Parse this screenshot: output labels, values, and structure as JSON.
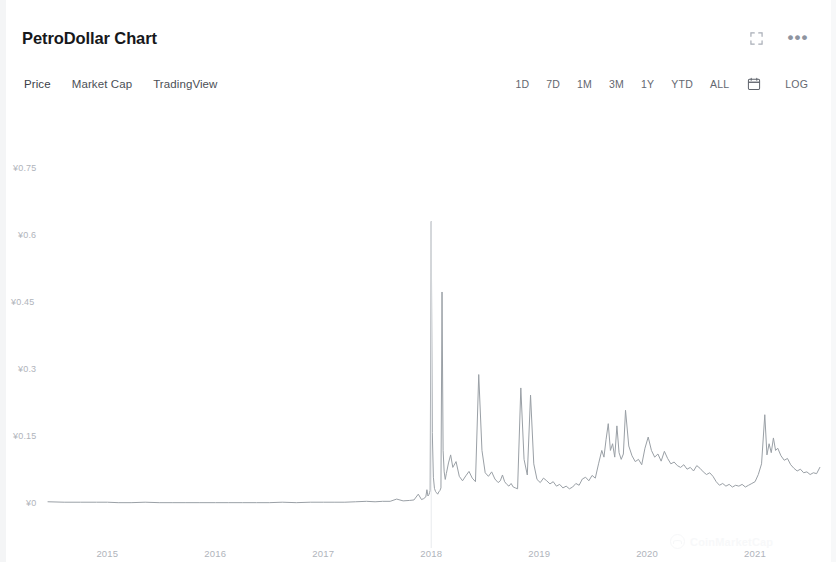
{
  "header": {
    "title": "PetroDollar Chart",
    "expand_icon": "fullscreen-icon",
    "more_icon": "more-options-icon"
  },
  "toolbar": {
    "tabs": [
      {
        "label": "Price",
        "active": true
      },
      {
        "label": "Market Cap",
        "active": false
      },
      {
        "label": "TradingView",
        "active": false
      }
    ],
    "ranges": [
      {
        "label": "1D"
      },
      {
        "label": "7D"
      },
      {
        "label": "1M"
      },
      {
        "label": "3M"
      },
      {
        "label": "1Y"
      },
      {
        "label": "YTD"
      },
      {
        "label": "ALL"
      }
    ],
    "calendar_icon": "calendar-icon",
    "log_label": "LOG"
  },
  "watermark": {
    "text": "CoinMarketCap",
    "logo": "coinmarketcap-logo"
  },
  "colors": {
    "line": "#9aa0a6",
    "title": "#17181b",
    "tick": "#b0b4bb",
    "background": "#ffffff"
  },
  "chart_data": {
    "type": "line",
    "title": "PetroDollar Chart",
    "xlabel": "",
    "ylabel": "",
    "currency_symbol": "¥",
    "grid": false,
    "legend": null,
    "y_ticks": [
      "¥0.75",
      "¥0.6",
      "¥0.45",
      "¥0.3",
      "¥0.15",
      "¥0"
    ],
    "y_tick_values": [
      0.75,
      0.6,
      0.45,
      0.3,
      0.15,
      0
    ],
    "ylim": [
      0,
      0.82
    ],
    "x_ticks": [
      "2015",
      "2016",
      "2017",
      "2018",
      "2019",
      "2020",
      "2021"
    ],
    "x_tick_values": [
      2015,
      2016,
      2017,
      2018,
      2019,
      2020,
      2021
    ],
    "xlim": [
      2014.45,
      2021.62
    ],
    "series": [
      {
        "name": "Price",
        "color": "#9aa0a6",
        "x": [
          2014.45,
          2014.6,
          2014.75,
          2014.9,
          2015.0,
          2015.1,
          2015.22,
          2015.35,
          2015.48,
          2015.6,
          2015.72,
          2015.85,
          2016.0,
          2016.12,
          2016.25,
          2016.38,
          2016.5,
          2016.62,
          2016.75,
          2016.88,
          2017.0,
          2017.1,
          2017.2,
          2017.3,
          2017.4,
          2017.48,
          2017.55,
          2017.62,
          2017.68,
          2017.74,
          2017.8,
          2017.84,
          2017.88,
          2017.91,
          2017.93,
          2017.95,
          2017.96,
          2017.97,
          2017.975,
          2017.98,
          2017.985,
          2017.99,
          2018.0,
          2018.01,
          2018.02,
          2018.03,
          2018.04,
          2018.05,
          2018.06,
          2018.07,
          2018.08,
          2018.09,
          2018.1,
          2018.11,
          2018.12,
          2018.13,
          2018.14,
          2018.16,
          2018.18,
          2018.2,
          2018.23,
          2018.26,
          2018.29,
          2018.32,
          2018.35,
          2018.38,
          2018.41,
          2018.44,
          2018.47,
          2018.5,
          2018.53,
          2018.56,
          2018.59,
          2018.62,
          2018.64,
          2018.66,
          2018.68,
          2018.7,
          2018.72,
          2018.74,
          2018.76,
          2018.78,
          2018.8,
          2018.83,
          2018.86,
          2018.89,
          2018.92,
          2018.95,
          2018.98,
          2019.01,
          2019.04,
          2019.07,
          2019.1,
          2019.13,
          2019.16,
          2019.19,
          2019.22,
          2019.25,
          2019.28,
          2019.31,
          2019.34,
          2019.37,
          2019.4,
          2019.43,
          2019.46,
          2019.49,
          2019.52,
          2019.55,
          2019.58,
          2019.6,
          2019.62,
          2019.64,
          2019.66,
          2019.68,
          2019.7,
          2019.72,
          2019.74,
          2019.76,
          2019.78,
          2019.8,
          2019.83,
          2019.86,
          2019.89,
          2019.92,
          2019.95,
          2019.98,
          2020.01,
          2020.04,
          2020.07,
          2020.1,
          2020.13,
          2020.16,
          2020.19,
          2020.22,
          2020.25,
          2020.28,
          2020.31,
          2020.34,
          2020.37,
          2020.4,
          2020.43,
          2020.46,
          2020.49,
          2020.52,
          2020.55,
          2020.58,
          2020.61,
          2020.64,
          2020.67,
          2020.7,
          2020.73,
          2020.76,
          2020.79,
          2020.82,
          2020.85,
          2020.88,
          2020.91,
          2020.94,
          2020.97,
          2021.0,
          2021.03,
          2021.06,
          2021.09,
          2021.11,
          2021.13,
          2021.15,
          2021.17,
          2021.19,
          2021.21,
          2021.24,
          2021.27,
          2021.3,
          2021.33,
          2021.36,
          2021.39,
          2021.42,
          2021.45,
          2021.48,
          2021.51,
          2021.54,
          2021.57,
          2021.6
        ],
        "y": [
          0.005,
          0.004,
          0.004,
          0.004,
          0.004,
          0.003,
          0.003,
          0.004,
          0.003,
          0.003,
          0.003,
          0.003,
          0.003,
          0.003,
          0.003,
          0.003,
          0.003,
          0.004,
          0.003,
          0.004,
          0.004,
          0.004,
          0.004,
          0.005,
          0.006,
          0.005,
          0.006,
          0.006,
          0.011,
          0.007,
          0.008,
          0.009,
          0.022,
          0.01,
          0.012,
          0.016,
          0.032,
          0.018,
          0.02,
          0.021,
          0.026,
          0.03,
          0.633,
          0.16,
          0.06,
          0.035,
          0.028,
          0.025,
          0.022,
          0.027,
          0.03,
          0.036,
          0.475,
          0.12,
          0.072,
          0.055,
          0.068,
          0.092,
          0.11,
          0.082,
          0.095,
          0.062,
          0.052,
          0.063,
          0.073,
          0.058,
          0.05,
          0.29,
          0.12,
          0.07,
          0.062,
          0.072,
          0.056,
          0.048,
          0.052,
          0.065,
          0.05,
          0.044,
          0.04,
          0.046,
          0.038,
          0.036,
          0.034,
          0.26,
          0.1,
          0.065,
          0.244,
          0.09,
          0.055,
          0.048,
          0.058,
          0.052,
          0.045,
          0.05,
          0.04,
          0.044,
          0.036,
          0.04,
          0.034,
          0.038,
          0.046,
          0.042,
          0.056,
          0.06,
          0.052,
          0.064,
          0.058,
          0.09,
          0.12,
          0.105,
          0.145,
          0.18,
          0.12,
          0.135,
          0.105,
          0.175,
          0.115,
          0.1,
          0.112,
          0.21,
          0.13,
          0.108,
          0.095,
          0.1,
          0.088,
          0.125,
          0.15,
          0.12,
          0.105,
          0.112,
          0.096,
          0.118,
          0.102,
          0.09,
          0.094,
          0.086,
          0.082,
          0.088,
          0.078,
          0.082,
          0.074,
          0.086,
          0.08,
          0.072,
          0.066,
          0.07,
          0.062,
          0.05,
          0.042,
          0.046,
          0.04,
          0.044,
          0.038,
          0.042,
          0.04,
          0.044,
          0.038,
          0.042,
          0.046,
          0.05,
          0.066,
          0.09,
          0.2,
          0.11,
          0.135,
          0.115,
          0.148,
          0.12,
          0.125,
          0.108,
          0.098,
          0.102,
          0.088,
          0.08,
          0.074,
          0.078,
          0.07,
          0.072,
          0.066,
          0.07,
          0.068,
          0.082
        ]
      }
    ],
    "annotations": [
      {
        "label": "all-time-high-spike",
        "x": 2018.0,
        "y": 0.633
      }
    ]
  }
}
